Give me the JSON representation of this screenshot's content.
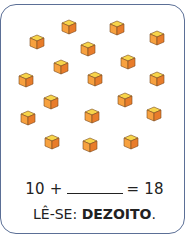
{
  "exercise": {
    "cube_count": 18,
    "cube_colors": {
      "top": "#f7d44a",
      "left": "#f7a13f",
      "right": "#e87c2a",
      "edge": "#7a4a1e"
    },
    "cubes": [
      {
        "x": 69,
        "y": 27
      },
      {
        "x": 117,
        "y": 28
      },
      {
        "x": 37,
        "y": 42
      },
      {
        "x": 157,
        "y": 38
      },
      {
        "x": 88,
        "y": 49
      },
      {
        "x": 128,
        "y": 62
      },
      {
        "x": 61,
        "y": 67
      },
      {
        "x": 26,
        "y": 80
      },
      {
        "x": 95,
        "y": 79
      },
      {
        "x": 157,
        "y": 79
      },
      {
        "x": 51,
        "y": 102
      },
      {
        "x": 125,
        "y": 100
      },
      {
        "x": 28,
        "y": 118
      },
      {
        "x": 92,
        "y": 116
      },
      {
        "x": 154,
        "y": 114
      },
      {
        "x": 52,
        "y": 142
      },
      {
        "x": 90,
        "y": 145
      },
      {
        "x": 131,
        "y": 142
      }
    ],
    "equation": {
      "left": "10 +",
      "right": "= 18"
    },
    "reading": {
      "prefix": "LÊ-SE:",
      "word": "DEZOITO",
      "suffix": "."
    }
  }
}
